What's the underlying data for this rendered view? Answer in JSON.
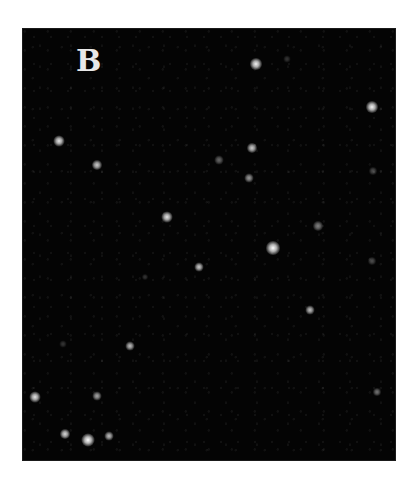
{
  "figure": {
    "panel_label": "B",
    "background_color": "#040404",
    "page_color": "#ffffff",
    "spot_color": "#ffffff"
  },
  "spots": [
    {
      "x": 256,
      "y": 64,
      "size": 12,
      "intensity": 0.95
    },
    {
      "x": 372,
      "y": 107,
      "size": 12,
      "intensity": 0.95
    },
    {
      "x": 59,
      "y": 141,
      "size": 11,
      "intensity": 0.9
    },
    {
      "x": 97,
      "y": 165,
      "size": 10,
      "intensity": 0.8
    },
    {
      "x": 252,
      "y": 148,
      "size": 10,
      "intensity": 0.8
    },
    {
      "x": 219,
      "y": 160,
      "size": 9,
      "intensity": 0.4
    },
    {
      "x": 249,
      "y": 178,
      "size": 9,
      "intensity": 0.6
    },
    {
      "x": 287,
      "y": 59,
      "size": 7,
      "intensity": 0.2
    },
    {
      "x": 167,
      "y": 217,
      "size": 11,
      "intensity": 0.9
    },
    {
      "x": 273,
      "y": 248,
      "size": 14,
      "intensity": 1.0
    },
    {
      "x": 318,
      "y": 226,
      "size": 10,
      "intensity": 0.5
    },
    {
      "x": 373,
      "y": 171,
      "size": 8,
      "intensity": 0.3
    },
    {
      "x": 199,
      "y": 267,
      "size": 9,
      "intensity": 0.8
    },
    {
      "x": 145,
      "y": 277,
      "size": 6,
      "intensity": 0.2
    },
    {
      "x": 372,
      "y": 261,
      "size": 8,
      "intensity": 0.3
    },
    {
      "x": 310,
      "y": 310,
      "size": 9,
      "intensity": 0.75
    },
    {
      "x": 130,
      "y": 346,
      "size": 9,
      "intensity": 0.75
    },
    {
      "x": 63,
      "y": 344,
      "size": 7,
      "intensity": 0.2
    },
    {
      "x": 35,
      "y": 397,
      "size": 11,
      "intensity": 0.9
    },
    {
      "x": 97,
      "y": 396,
      "size": 9,
      "intensity": 0.65
    },
    {
      "x": 377,
      "y": 392,
      "size": 8,
      "intensity": 0.45
    },
    {
      "x": 65,
      "y": 434,
      "size": 10,
      "intensity": 0.85
    },
    {
      "x": 88,
      "y": 440,
      "size": 13,
      "intensity": 1.0
    },
    {
      "x": 109,
      "y": 436,
      "size": 9,
      "intensity": 0.75
    }
  ]
}
